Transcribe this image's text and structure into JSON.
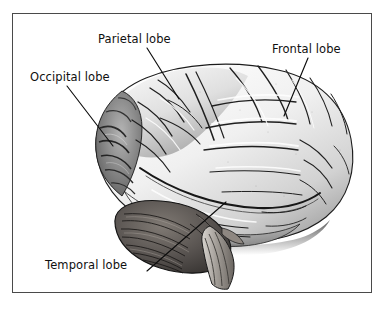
{
  "figure": {
    "frame": {
      "border_color": "#4a4a4a",
      "background_color": "#ffffff"
    }
  },
  "labels": [
    {
      "id": "parietal",
      "text": "Parietal lobe",
      "leader": {
        "x1": 147,
        "y1": 48,
        "x2": 179,
        "y2": 99
      }
    },
    {
      "id": "frontal",
      "text": "Frontal lobe",
      "leader": {
        "x1": 308,
        "y1": 58,
        "x2": 284,
        "y2": 116
      }
    },
    {
      "id": "occipital",
      "text": "Occipital lobe",
      "leader": {
        "x1": 67,
        "y1": 86,
        "x2": 113,
        "y2": 146
      }
    },
    {
      "id": "temporal",
      "text": "Temporal lobe",
      "leader": {
        "x1": 147,
        "y1": 271,
        "x2": 226,
        "y2": 202
      }
    }
  ],
  "illustration": {
    "subject": "human-brain-lateral",
    "style": "grayscale-engraving",
    "regions": [
      {
        "name": "frontal-lobe",
        "tone": "#f2f2f2"
      },
      {
        "name": "parietal-lobe",
        "tone": "#e2e2e2"
      },
      {
        "name": "occipital-lobe",
        "tone": "#8a8a8a"
      },
      {
        "name": "temporal-lobe",
        "tone": "#dcdcdc"
      },
      {
        "name": "cerebellum",
        "tone": "#55504c"
      },
      {
        "name": "brainstem",
        "tone": "#9a9590"
      }
    ],
    "colors": {
      "outline": "#1a1a1a",
      "light": "#fbfbfb",
      "midtone": "#c9c9c9",
      "shadow": "#6b6b6b",
      "dark": "#3a3a3a"
    }
  }
}
